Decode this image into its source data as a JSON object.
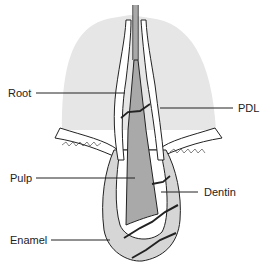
{
  "diagram": {
    "type": "tooth-anatomy-cross-section",
    "labels": {
      "root": "Root",
      "pdl": "PDL",
      "pulp": "Pulp",
      "dentin": "Dentin",
      "enamel": "Enamel"
    },
    "colors": {
      "bone": "#e6e6e6",
      "pulp": "#a9a9a9",
      "enamel": "#d6d6d6",
      "dentin": "#ffffff",
      "line": "#222222"
    }
  }
}
